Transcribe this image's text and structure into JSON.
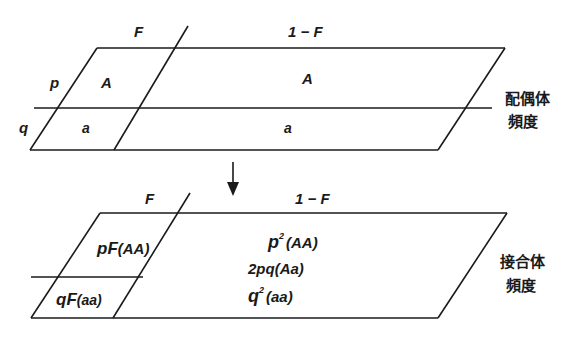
{
  "top_panel": {
    "column_labels": {
      "inbred": "F",
      "random": "1 − F"
    },
    "row_labels": {
      "p": "p",
      "q": "q"
    },
    "cells": {
      "inbred_A": "A",
      "inbred_a": "a",
      "random_A": "A",
      "random_a": "a"
    },
    "side_label": {
      "line1": "配偶体",
      "line2": "頻度"
    }
  },
  "bottom_panel": {
    "column_labels": {
      "inbred": "F",
      "random": "1 − F"
    },
    "cells": {
      "inbred_AA": {
        "coef": "pF",
        "genotype": "(AA)"
      },
      "inbred_aa": {
        "coef": "qF",
        "genotype": "(aa)"
      },
      "random_AA": {
        "base": "p",
        "exp": "2",
        "genotype": "(AA)"
      },
      "random_Aa": {
        "coef": "2pq",
        "genotype": "(Aa)"
      },
      "random_aa": {
        "base": "q",
        "exp": "2",
        "genotype": "(aa)"
      }
    },
    "side_label": {
      "line1": "接合体",
      "line2": "頻度"
    }
  },
  "arrow": {
    "icon": "down-arrow-icon"
  }
}
